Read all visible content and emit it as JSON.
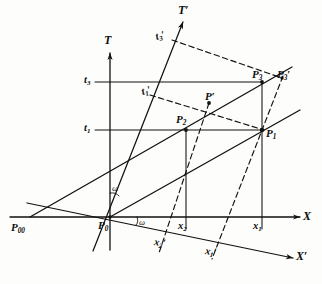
{
  "figure": {
    "kind": "minkowski-spacetime-diagram",
    "ink_color": "#111111",
    "paper_color": "#fdfdfb"
  },
  "axes": [
    {
      "id": "X",
      "label": "X",
      "primed": false,
      "kind": "space",
      "frame": "unprimed"
    },
    {
      "id": "T",
      "label": "T",
      "primed": false,
      "kind": "time",
      "frame": "unprimed"
    },
    {
      "id": "Xp",
      "label": "X",
      "primed": true,
      "kind": "space",
      "frame": "primed"
    },
    {
      "id": "Tp",
      "label": "T",
      "primed": true,
      "kind": "time",
      "frame": "primed"
    }
  ],
  "angles": [
    {
      "id": "omega-t",
      "label": "ω",
      "between": "T and T'"
    },
    {
      "id": "omega-x",
      "label": "ω",
      "between": "X and X'"
    }
  ],
  "points": [
    {
      "id": "P00",
      "label": "P",
      "sub": "00",
      "primed": false,
      "x": 18,
      "y": 229
    },
    {
      "id": "P0",
      "label": "P",
      "sub": "0",
      "primed": false,
      "x": 99,
      "y": 227
    },
    {
      "id": "P1",
      "label": "P",
      "sub": "1",
      "primed": false,
      "x": 262,
      "y": 133
    },
    {
      "id": "P2",
      "label": "P",
      "sub": "2",
      "primed": false,
      "x": 172,
      "y": 121
    },
    {
      "id": "P3",
      "label": "P",
      "sub": "3",
      "primed": false,
      "x": 252,
      "y": 75
    },
    {
      "id": "Pp",
      "label": "P",
      "sub": "",
      "primed": true,
      "x": 208,
      "y": 104
    },
    {
      "id": "P3p",
      "label": "P",
      "sub": "3",
      "primed": true,
      "x": 280,
      "y": 74
    }
  ],
  "ticks": [
    {
      "id": "t3",
      "label": "t",
      "sub": "3",
      "primed": false,
      "axis": "T",
      "x": 86,
      "y": 76
    },
    {
      "id": "t1",
      "label": "t",
      "sub": "1",
      "primed": false,
      "axis": "T",
      "x": 86,
      "y": 124
    },
    {
      "id": "t1p",
      "label": "t",
      "sub": "1",
      "primed": true,
      "axis": "Tp",
      "x": 145,
      "y": 89
    },
    {
      "id": "t3p",
      "label": "t",
      "sub": "3",
      "primed": true,
      "axis": "Tp",
      "x": 158,
      "y": 34
    },
    {
      "id": "x1",
      "label": "x",
      "sub": "1",
      "primed": false,
      "axis": "X",
      "x": 252,
      "y": 223
    },
    {
      "id": "x2",
      "label": "x",
      "sub": "2",
      "primed": false,
      "axis": "X",
      "x": 181,
      "y": 223
    },
    {
      "id": "x1p",
      "label": "x",
      "sub": "1",
      "primed": true,
      "axis": "Xp",
      "x": 207,
      "y": 248
    },
    {
      "id": "x2p",
      "label": "x",
      "sub": "2",
      "primed": true,
      "axis": "Xp",
      "x": 156,
      "y": 239
    }
  ],
  "geometry": {
    "origin": {
      "x": 110,
      "y": 217
    },
    "x_axis": {
      "x1": 10,
      "y1": 217,
      "x2": 302,
      "y2": 217
    },
    "t_axis": {
      "x1": 110,
      "y1": 52,
      "x2": 110,
      "y2": 250
    },
    "xp_axis": {
      "x1": 27,
      "y1": 203,
      "x2": 296,
      "y2": 259
    },
    "tp_axis": {
      "x1": 93,
      "y1": 251,
      "x2": 183,
      "y2": 21
    },
    "worldline_1": {
      "x1": 110,
      "y1": 217,
      "x2": 297,
      "y2": 111
    },
    "worldline_2": {
      "x1": 30,
      "y1": 217,
      "x2": 290,
      "y2": 68
    },
    "gridline_t3": {
      "x1": 95,
      "y1": 82,
      "x2": 262,
      "y2": 82
    },
    "gridline_t1": {
      "x1": 95,
      "y1": 130,
      "x2": 262,
      "y2": 130
    },
    "drop_x1": {
      "x1": 262,
      "y1": 82,
      "x2": 262,
      "y2": 228
    },
    "drop_x2": {
      "x1": 186,
      "y1": 130,
      "x2": 186,
      "y2": 228
    },
    "dashed_t1p_P1": {
      "x1": 152,
      "y1": 96,
      "x2": 262,
      "y2": 130
    },
    "dashed_t3p_P3p": {
      "x1": 174,
      "y1": 41,
      "x2": 281,
      "y2": 78
    },
    "dashed_x1p": {
      "x1": 281,
      "y1": 78,
      "x2": 213,
      "y2": 258
    },
    "dashed_x2p": {
      "x1": 208,
      "y1": 104,
      "x2": 160,
      "y2": 252
    }
  }
}
